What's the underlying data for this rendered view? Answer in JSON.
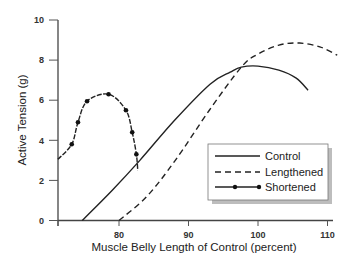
{
  "chart_data": {
    "type": "line",
    "title": "",
    "xlabel": "Muscle Belly Length of Control (percent)",
    "ylabel": "Active Tension (g)",
    "xlim": [
      71.6,
      112
    ],
    "ylim": [
      0,
      10
    ],
    "x_ticks": [
      80,
      90,
      100,
      110
    ],
    "y_ticks": [
      0,
      2,
      4,
      6,
      8,
      10
    ],
    "grid": false,
    "legend_position": "lower right (inside plot)",
    "series": [
      {
        "name": "Control",
        "style": "solid",
        "x": [
          74.7,
          79,
          83,
          88,
          93.1,
          96,
          97.6,
          100,
          103,
          105.5,
          107.2
        ],
        "y": [
          0,
          1.5,
          3.0,
          5.0,
          6.8,
          7.4,
          7.65,
          7.7,
          7.5,
          7.1,
          6.5
        ]
      },
      {
        "name": "Lengthened",
        "style": "dashed",
        "x": [
          80,
          84,
          88.1,
          93,
          97.6,
          100,
          103,
          106,
          109,
          111.4
        ],
        "y": [
          0,
          1.2,
          3.0,
          5.5,
          7.65,
          8.3,
          8.75,
          8.85,
          8.65,
          8.25
        ]
      },
      {
        "name": "Shortened",
        "style": "dash-dot with markers",
        "x": [
          71.2,
          73.2,
          74.1,
          75.4,
          78.5,
          81.0,
          81.9,
          82.5,
          82.7
        ],
        "y": [
          3.05,
          3.8,
          4.9,
          5.95,
          6.3,
          5.5,
          4.4,
          3.3,
          2.5
        ],
        "markers": [
          {
            "x": 73.2,
            "y": 3.8
          },
          {
            "x": 74.1,
            "y": 4.9
          },
          {
            "x": 75.4,
            "y": 5.95
          },
          {
            "x": 78.5,
            "y": 6.3
          },
          {
            "x": 81.0,
            "y": 5.5
          },
          {
            "x": 81.9,
            "y": 4.4
          },
          {
            "x": 82.5,
            "y": 3.3
          }
        ]
      }
    ]
  },
  "labels": {
    "xlabel": "Muscle Belly Length of Control (percent)",
    "ylabel": "Active Tension (g)",
    "x_ticks": [
      "80",
      "90",
      "100",
      "110"
    ],
    "y_ticks": [
      "0",
      "2",
      "4",
      "6",
      "8",
      "10"
    ],
    "legend": [
      "Control",
      "Lengthened",
      "Shortened"
    ]
  },
  "colors": {
    "line": "#222222",
    "axis": "#444444",
    "legend_shadow": "#b8b8b8"
  }
}
